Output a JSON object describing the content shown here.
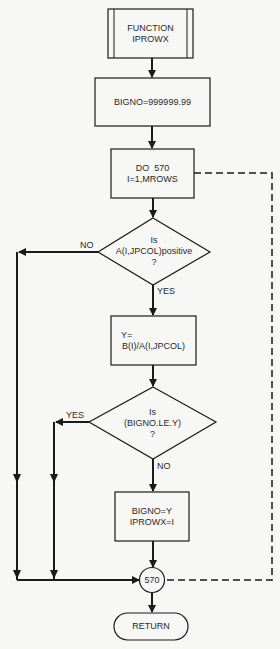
{
  "diagram": {
    "type": "flowchart",
    "nodes": {
      "start": {
        "line1": "FUNCTION",
        "line2": "IPROWX",
        "shape": "predefined-process"
      },
      "init": {
        "text": "BIGNO=999999.99",
        "shape": "process"
      },
      "loop": {
        "line1": "DO  570",
        "line2": "I=1,MROWS",
        "shape": "process"
      },
      "decision1": {
        "line1": "Is",
        "line2": "A(I,JPCOL)positive",
        "line3": "?",
        "shape": "decision"
      },
      "compute": {
        "line1": "Y=",
        "line2": "B(I)/A(I,JPCOL)",
        "shape": "process"
      },
      "decision2": {
        "line1": "Is",
        "line2": "(BIGNO.LE.Y)",
        "line3": "?",
        "shape": "decision"
      },
      "update": {
        "line1": "BIGNO=Y",
        "line2": "IPROWX=I",
        "shape": "process"
      },
      "connector": {
        "text": "570",
        "shape": "connector"
      },
      "end": {
        "text": "RETURN",
        "shape": "terminator"
      }
    },
    "edges": {
      "d1_no": "NO",
      "d1_yes": "YES",
      "d2_yes": "YES",
      "d2_no": "NO"
    },
    "colors": {
      "stroke": "#1a1a1a",
      "background": "#f7f7f5"
    }
  }
}
